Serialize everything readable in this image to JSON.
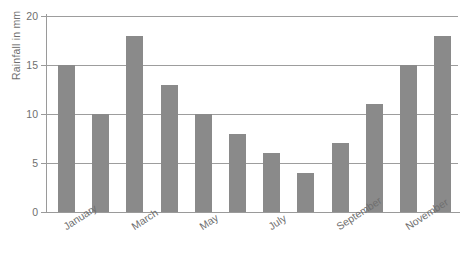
{
  "chart_data": {
    "type": "bar",
    "title": "",
    "subtitle": "",
    "xlabel": "",
    "ylabel": "Rainfall in mm",
    "categories": [
      "January",
      "February",
      "March",
      "April",
      "May",
      "June",
      "July",
      "August",
      "September",
      "October",
      "November",
      "December"
    ],
    "visible_tick_labels": [
      "January",
      "March",
      "May",
      "July",
      "September",
      "November"
    ],
    "values": [
      15,
      10,
      18,
      13,
      10,
      8,
      6,
      4,
      7,
      11,
      15,
      18
    ],
    "ylim": [
      0,
      20
    ],
    "y_ticks": [
      0,
      5,
      10,
      15,
      20
    ],
    "y_tick_labels": [
      "0",
      "5",
      "10",
      "15",
      "20"
    ],
    "grid": "horizontal",
    "legend": "none",
    "bar_color": "#8a8a8a",
    "axis_color": "#9a9a9a",
    "grid_color": "#9d9d9d",
    "text_color": "#6f6f6f",
    "background_color": "#ffffff",
    "x_label_rotation_deg": -33
  }
}
